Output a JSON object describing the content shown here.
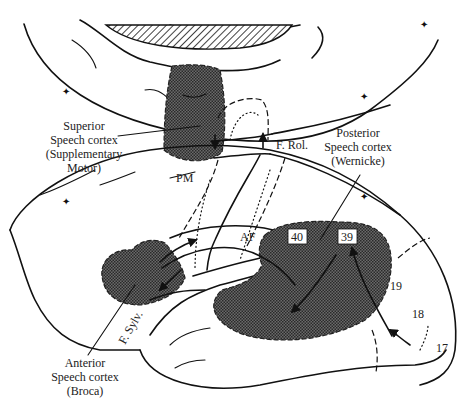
{
  "diagram": {
    "labels": {
      "superior": [
        "Superior",
        "Speech cortex",
        "(Supplementary",
        "Motor)"
      ],
      "posterior": [
        "Posterior",
        "Speech cortex",
        "(Wernicke)"
      ],
      "anterior": [
        "Anterior",
        "Speech cortex",
        "(Broca)"
      ],
      "pm": "PM",
      "af": "AF",
      "f_rol": "F. Rol.",
      "f_sylv": "F. Sylv."
    },
    "areas": {
      "a40": "40",
      "a39": "39",
      "a19": "19",
      "a18": "18",
      "a17": "17"
    },
    "colors": {
      "ink": "#111111",
      "shade": "#555555",
      "background": "#ffffff"
    }
  }
}
